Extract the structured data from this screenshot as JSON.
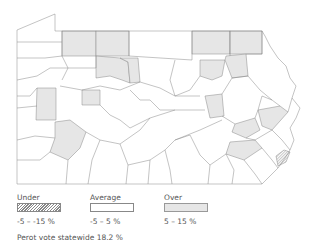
{
  "map": {
    "region": "Pennsylvania counties",
    "colors": {
      "under_fill": "hatched",
      "average_fill": "#ffffff",
      "over_fill": "#e6e6e6",
      "border": "#888888"
    }
  },
  "legend": {
    "items": [
      {
        "label": "Under",
        "range": "-5 –  -15 %"
      },
      {
        "label": "Average",
        "range": "-5 – 5 %"
      },
      {
        "label": "Over",
        "range": "5 – 15 %"
      }
    ],
    "note": "Perot vote statewide 18.2 %"
  }
}
